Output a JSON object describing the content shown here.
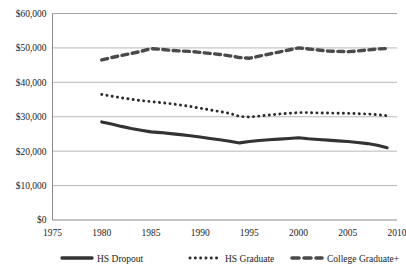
{
  "chart_data": {
    "type": "line",
    "title": "",
    "xlabel": "",
    "ylabel": "",
    "xlim": [
      1975,
      2010
    ],
    "ylim": [
      0,
      60000
    ],
    "grid": true,
    "legend_position": "bottom",
    "xticks": [
      "1975",
      "1980",
      "1985",
      "1990",
      "1995",
      "2000",
      "2005",
      "2010"
    ],
    "xtick_values": [
      1975,
      1980,
      1985,
      1990,
      1995,
      2000,
      2005,
      2010
    ],
    "yticks": [
      "$0",
      "$10,000",
      "$20,000",
      "$30,000",
      "$40,000",
      "$50,000",
      "$60,000"
    ],
    "ytick_values": [
      0,
      10000,
      20000,
      30000,
      40000,
      50000,
      60000
    ],
    "x": [
      1980,
      1981,
      1982,
      1983,
      1984,
      1985,
      1986,
      1987,
      1988,
      1989,
      1990,
      1991,
      1992,
      1993,
      1994,
      1995,
      1996,
      1997,
      1998,
      1999,
      2000,
      2001,
      2002,
      2003,
      2004,
      2005,
      2006,
      2007,
      2008,
      2009
    ],
    "series": [
      {
        "name": "HS Dropout",
        "style": "solid-thick",
        "color": "#333333",
        "values": [
          28500,
          27900,
          27200,
          26600,
          26100,
          25600,
          25400,
          25100,
          24800,
          24500,
          24100,
          23700,
          23300,
          22900,
          22400,
          22800,
          23100,
          23300,
          23500,
          23700,
          23900,
          23600,
          23400,
          23200,
          23000,
          22800,
          22500,
          22200,
          21700,
          21000
        ]
      },
      {
        "name": "HS Graduate",
        "style": "dotted",
        "color": "#2b2b2b",
        "values": [
          36500,
          36000,
          35500,
          35100,
          34700,
          34400,
          34100,
          33800,
          33400,
          33000,
          32500,
          32000,
          31500,
          31000,
          30100,
          29900,
          30200,
          30500,
          30800,
          31000,
          31200,
          31200,
          31100,
          31100,
          31000,
          31000,
          30900,
          30800,
          30600,
          30300
        ]
      },
      {
        "name": "College Graduate+",
        "style": "dashed-thick",
        "color": "#4a4a4a",
        "values": [
          46500,
          47200,
          47800,
          48400,
          49000,
          49800,
          49600,
          49300,
          49100,
          49000,
          48700,
          48400,
          48100,
          47700,
          47200,
          47000,
          47600,
          48200,
          48800,
          49400,
          50000,
          49700,
          49400,
          49100,
          49000,
          48900,
          49100,
          49400,
          49700,
          49800
        ]
      }
    ]
  },
  "legend": {
    "items": [
      {
        "label": "HS Dropout"
      },
      {
        "label": "HS Graduate"
      },
      {
        "label": "College Graduate+"
      }
    ]
  }
}
